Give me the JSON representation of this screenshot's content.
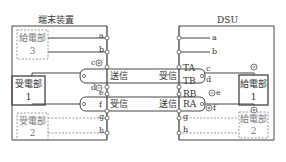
{
  "diagram": {
    "left_device": {
      "title": "端末装置",
      "feed_unit_3": {
        "label": "給電部",
        "number": "3"
      },
      "receive_unit_1": {
        "label": "受電部",
        "number": "1"
      },
      "receive_unit_2": {
        "label": "受電部",
        "number": "2"
      },
      "terminals": [
        "a",
        "b",
        "c",
        "d",
        "e",
        "f",
        "g",
        "h"
      ]
    },
    "right_device": {
      "title": "DSU",
      "feed_unit_1": {
        "label": "給電部",
        "number": "1"
      },
      "feed_unit_2": {
        "label": "給電部",
        "number": "2"
      },
      "terminals": [
        "a",
        "b",
        "c",
        "d",
        "e",
        "f",
        "g",
        "h"
      ],
      "pins": [
        "TA",
        "TB",
        "RB",
        "RA"
      ]
    },
    "pair_upper": {
      "left_label": "送信",
      "right_label": "受信"
    },
    "pair_lower": {
      "left_label": "受信",
      "right_label": "送信"
    },
    "polarity": {
      "plus": "+",
      "minus": "−"
    }
  }
}
